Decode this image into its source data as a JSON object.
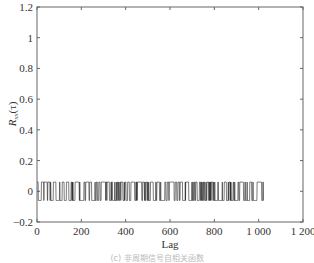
{
  "chart_data": {
    "type": "line",
    "title": "",
    "xlabel": "Lag",
    "ylabel": "R_xx(τ)",
    "ylabel_main": "R",
    "ylabel_sub": "xx",
    "ylabel_arg": "(τ)",
    "xlim": [
      0,
      1200
    ],
    "ylim": [
      -0.2,
      1.2
    ],
    "xticks": [
      0,
      200,
      400,
      600,
      800,
      1000,
      1200
    ],
    "xtick_labels": [
      "0",
      "200",
      "400",
      "600",
      "800",
      "1 000",
      "1 200"
    ],
    "yticks": [
      -0.2,
      0,
      0.2,
      0.4,
      0.6,
      0.8,
      1,
      1.2
    ],
    "ytick_labels": [
      "−0.2",
      "0",
      "0.2",
      "0.4",
      "0.6",
      "0.8",
      "1",
      "1.2"
    ],
    "grid": false,
    "legend": null,
    "series": [
      {
        "name": "autocorrelation",
        "description": "Binary-valued correlation alternating between approx +0.06 and −0.06 over lags 0–1023",
        "x_range": [
          0,
          1023
        ],
        "levels": [
          0.06,
          -0.06
        ],
        "color": "#222222"
      }
    ]
  },
  "caption": "(c) 非周期信号自相关函数"
}
